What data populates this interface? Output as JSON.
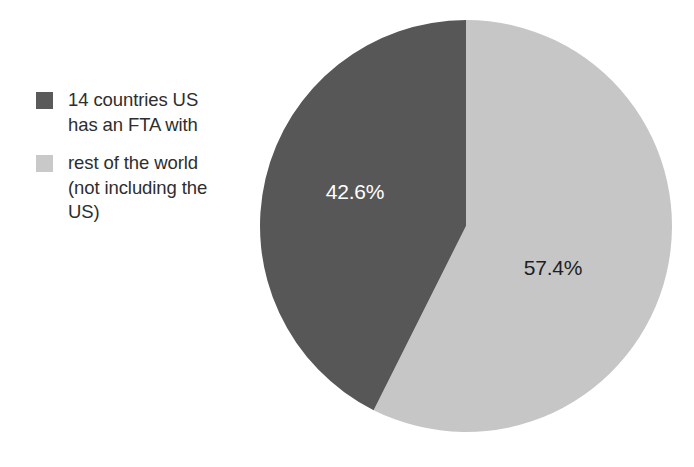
{
  "background": "#ffffff",
  "chart_data": {
    "type": "pie",
    "title": "",
    "legend_position": "left",
    "grid": false,
    "categories": [
      "14 countries US has an FTA with",
      "rest of the world (not including the US)"
    ],
    "values": [
      42.6,
      57.4
    ],
    "unit": "%",
    "data_labels": [
      "42.6%",
      "57.4%"
    ],
    "colors": [
      "#575757",
      "#c6c6c6"
    ],
    "start_angle_deg": 0,
    "direction": "clockwise",
    "note": "Light slice 'rest of the world' drawn clockwise from 12 o'clock spanning 206.6 degrees; dark slice 'FTA countries' fills the remaining 153.4 degrees."
  },
  "legend": {
    "items": [
      {
        "label": "14 countries US\nhas an FTA with",
        "color": "#5a5a5a",
        "swatch_name": "legend-swatch-fta-countries"
      },
      {
        "label": "rest of the world\n(not including the\nUS)",
        "color": "#c9c9c9",
        "swatch_name": "legend-swatch-rest-of-world"
      }
    ]
  },
  "pie": {
    "center_x": 466,
    "center_y": 226,
    "radius": 206,
    "slices": [
      {
        "name": "fta-countries",
        "label": "42.6%",
        "value": 42.6,
        "color": "#575757",
        "label_color": "#ffffff",
        "label_x": 355,
        "label_y": 199
      },
      {
        "name": "rest-of-world",
        "label": "57.4%",
        "value": 57.4,
        "color": "#c6c6c6",
        "label_color": "#1f1f1f",
        "label_x": 553,
        "label_y": 275
      }
    ]
  }
}
